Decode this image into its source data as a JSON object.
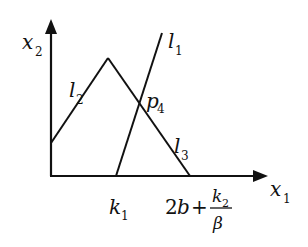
{
  "diagram": {
    "axes": {
      "x_axis": {
        "label": "x",
        "subscript": "1"
      },
      "y_axis": {
        "label": "x",
        "subscript": "2"
      }
    },
    "lines": [
      {
        "label": "l",
        "subscript": "1"
      },
      {
        "label": "l",
        "subscript": "2"
      },
      {
        "label": "l",
        "subscript": "3"
      }
    ],
    "points": [
      {
        "label": "p",
        "subscript": "4"
      }
    ],
    "ticks": {
      "k1": {
        "label": "k",
        "subscript": "1"
      },
      "end": {
        "prefix": "2",
        "var": "b",
        "plus": "+",
        "numerator": "k",
        "numerator_sub": "2",
        "denominator": "β"
      }
    },
    "colors": {
      "stroke": "#111111",
      "background": "#ffffff"
    }
  }
}
